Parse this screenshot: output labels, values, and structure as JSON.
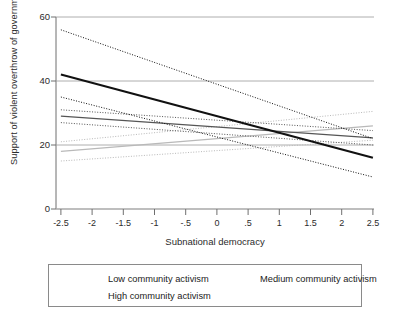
{
  "chart_data": {
    "type": "line",
    "title": "",
    "xlabel": "Subnational democracy",
    "ylabel": "Support of violent overthrow of government",
    "xlim": [
      -2.75,
      2.75
    ],
    "ylim": [
      0,
      62
    ],
    "xticks": [
      "-2.5",
      "-2",
      "-1.5",
      "-1",
      "-.5",
      "0",
      ".5",
      "1",
      "1.5",
      "2",
      "2.5"
    ],
    "xtick_values": [
      -2.5,
      -2,
      -1.5,
      -1,
      -0.5,
      0,
      0.5,
      1,
      1.5,
      2,
      2.5
    ],
    "yticks": [
      "0",
      "20",
      "40",
      "60"
    ],
    "ytick_values": [
      0,
      20,
      40,
      60
    ],
    "grid": "horizontal",
    "legend_position": "below-plot",
    "x": [
      -2.5,
      2.5
    ],
    "series": [
      {
        "name": "Low community activism",
        "style": "solid",
        "color": "#b9b9b9",
        "width": 1.3,
        "values": [
          18.0,
          26.0
        ],
        "ci_upper": [
          21.0,
          30.5
        ],
        "ci_lower": [
          15.0,
          21.5
        ]
      },
      {
        "name": "Medium community activism",
        "style": "solid",
        "color": "#555555",
        "width": 1.3,
        "values": [
          29.0,
          22.2
        ],
        "ci_upper": [
          31.0,
          24.5
        ],
        "ci_lower": [
          27.0,
          20.0
        ]
      },
      {
        "name": "High community activism",
        "style": "solid",
        "color": "#111111",
        "width": 2.1,
        "values": [
          42.0,
          16.0
        ],
        "ci_upper": [
          56.0,
          22.0
        ],
        "ci_lower": [
          35.0,
          10.0
        ]
      }
    ],
    "confidence_interval_style": "dotted"
  },
  "legend": {
    "items": [
      {
        "label": "Low community activism"
      },
      {
        "label": "Medium community activism"
      },
      {
        "label": "High community activism"
      }
    ]
  }
}
